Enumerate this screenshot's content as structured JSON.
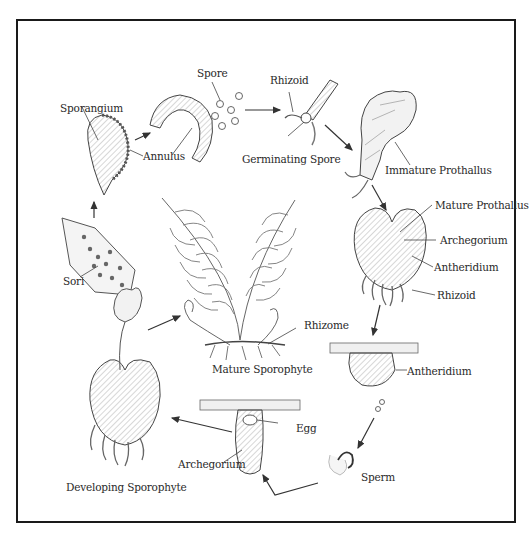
{
  "diagram": {
    "stages": [
      {
        "id": "sori",
        "label": "Sori"
      },
      {
        "id": "sporangium",
        "label": "Sporangium"
      },
      {
        "id": "annulus",
        "label": "Annulus"
      },
      {
        "id": "spore",
        "label": "Spore"
      },
      {
        "id": "rhizoid_top",
        "label": "Rhizoid"
      },
      {
        "id": "germinating_spore",
        "label": "Germinating Spore"
      },
      {
        "id": "immature_prothallus",
        "label": "Immature Prothallus"
      },
      {
        "id": "mature_prothallus",
        "label": "Mature Prothallus"
      },
      {
        "id": "archegorium_right",
        "label": "Archegorium"
      },
      {
        "id": "antheridium_right",
        "label": "Antheridium"
      },
      {
        "id": "rhizoid_right",
        "label": "Rhizoid"
      },
      {
        "id": "rhizome",
        "label": "Rhizome"
      },
      {
        "id": "mature_sporophyte",
        "label": "Mature Sporophyte"
      },
      {
        "id": "antheridium_lower",
        "label": "Antheridium"
      },
      {
        "id": "egg",
        "label": "Egg"
      },
      {
        "id": "archegorium_lower",
        "label": "Archegorium"
      },
      {
        "id": "sperm",
        "label": "Sperm"
      },
      {
        "id": "developing_sporophyte",
        "label": "Developing Sporophyte"
      }
    ],
    "colors": {
      "ink": "#2a2a2a",
      "frame": "#1a1a1a",
      "background": "#ffffff",
      "shade": "#d8d8d8"
    }
  }
}
